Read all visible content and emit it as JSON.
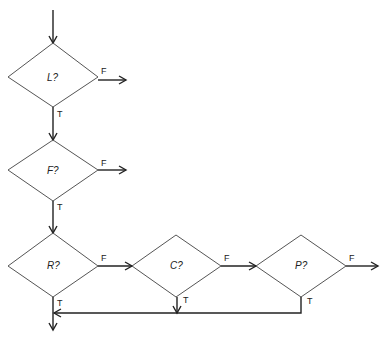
{
  "diagram": {
    "type": "flowchart",
    "decisions": [
      {
        "id": "L",
        "label": "L?",
        "true_label": "T",
        "false_label": "F"
      },
      {
        "id": "F",
        "label": "F?",
        "true_label": "T",
        "false_label": "F"
      },
      {
        "id": "R",
        "label": "R?",
        "true_label": "T",
        "false_label": "F"
      },
      {
        "id": "C",
        "label": "C?",
        "true_label": "T",
        "false_label": "F"
      },
      {
        "id": "P",
        "label": "P?",
        "true_label": "T",
        "false_label": "F"
      }
    ],
    "edges": [
      {
        "from": "start",
        "to": "L"
      },
      {
        "from": "L",
        "to": "exit",
        "label": "F"
      },
      {
        "from": "L",
        "to": "F",
        "label": "T"
      },
      {
        "from": "F",
        "to": "exit",
        "label": "F"
      },
      {
        "from": "F",
        "to": "R",
        "label": "T"
      },
      {
        "from": "R",
        "to": "C",
        "label": "F"
      },
      {
        "from": "R",
        "to": "end",
        "label": "T"
      },
      {
        "from": "C",
        "to": "P",
        "label": "F"
      },
      {
        "from": "C",
        "to": "merge",
        "label": "T"
      },
      {
        "from": "P",
        "to": "exit",
        "label": "F"
      },
      {
        "from": "P",
        "to": "merge",
        "label": "T"
      }
    ]
  }
}
